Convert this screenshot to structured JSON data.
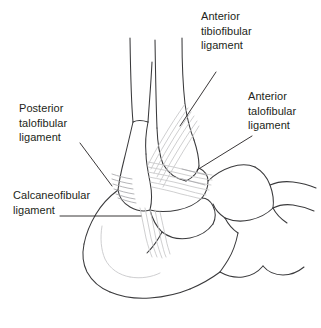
{
  "figure": {
    "width": 321,
    "height": 328,
    "background_color": "#ffffff",
    "line_color": "#3a3a3c",
    "ligament_color": "#c6c6c8",
    "text_color": "#231f20"
  },
  "labels": {
    "anterior_tibiofibular": {
      "line1": "Anterior",
      "line2": "tibiofibular",
      "line3": "ligament"
    },
    "anterior_talofibular": {
      "line1": "Anterior",
      "line2": "talofibular",
      "line3": "ligament"
    },
    "posterior_talofibular": {
      "line1": "Posterior",
      "line2": "talofibular",
      "line3": "ligament"
    },
    "calcaneofibular": {
      "line1": "Calcaneofibular",
      "line2": "ligament"
    }
  },
  "structures": [
    {
      "name": "fibula",
      "description": "lateral leg bone descending to lateral malleolus"
    },
    {
      "name": "tibia",
      "description": "medial leg bone, wider shaft"
    },
    {
      "name": "lateral-malleolus",
      "description": "distal fibular prominence"
    },
    {
      "name": "talus",
      "description": "ankle bone beneath tibia"
    },
    {
      "name": "calcaneus",
      "description": "heel bone"
    },
    {
      "name": "navicular",
      "description": "midfoot tarsal bone"
    },
    {
      "name": "cuneiform",
      "description": "forefoot tarsal bones"
    }
  ],
  "ligaments": [
    {
      "name": "anterior-tibiofibular-ligament"
    },
    {
      "name": "anterior-talofibular-ligament"
    },
    {
      "name": "posterior-talofibular-ligament"
    },
    {
      "name": "calcaneofibular-ligament"
    }
  ]
}
